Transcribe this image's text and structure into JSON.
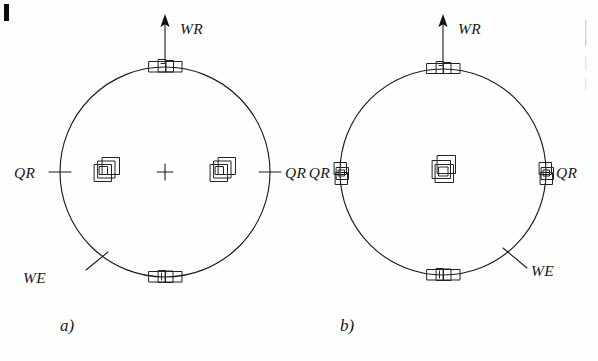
{
  "figure": {
    "caption_a": "a)",
    "caption_b": "b)",
    "panels": [
      {
        "id": "a",
        "caption": "a)",
        "center": [
          165,
          172
        ],
        "radius": 105,
        "top_label": "WR",
        "left_label": "QR",
        "right_label": "QR",
        "diagonal_label": "WE",
        "diagonal_label_side": "lower-left",
        "center_marker": "plus",
        "square_clusters": [
          {
            "position": "interior-left",
            "x": 106,
            "y": 172
          },
          {
            "position": "interior-right",
            "x": 222,
            "y": 172
          }
        ],
        "bracket_markers": [
          {
            "position": "top",
            "x": 165,
            "y": 67
          },
          {
            "position": "bottom",
            "x": 165,
            "y": 277
          }
        ]
      },
      {
        "id": "b",
        "caption": "b)",
        "center": [
          443,
          172
        ],
        "radius": 103,
        "top_label": "WR",
        "left_label": "QR",
        "right_label": "QR",
        "diagonal_label": "WE",
        "diagonal_label_side": "lower-right",
        "center_marker": "square-cluster",
        "square_clusters": [
          {
            "position": "center",
            "x": 443,
            "y": 172
          },
          {
            "position": "rim-left",
            "x": 340,
            "y": 174
          },
          {
            "position": "rim-right",
            "x": 546,
            "y": 174
          }
        ],
        "bracket_markers": [
          {
            "position": "top",
            "x": 443,
            "y": 69
          },
          {
            "position": "bottom",
            "x": 443,
            "y": 275
          }
        ]
      }
    ],
    "labels": {
      "wr_a": "WR",
      "wr_b": "WR",
      "qr_a_left": "QR",
      "qr_a_right": "QR",
      "qr_b_left": "QR",
      "qr_b_right": "QR",
      "we_a": "WE",
      "we_b": "WE"
    },
    "colors": {
      "ink": "#1c1c1c",
      "paper": "#fefefe",
      "artifact": "#0d0d0d",
      "artifact_faint": "#cfcfcf"
    }
  }
}
